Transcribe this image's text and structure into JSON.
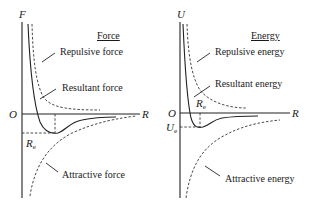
{
  "force_panel": {
    "title": "Force",
    "y_axis": "F",
    "x_axis": "R",
    "origin": "O",
    "re_label": "R",
    "re_sub": "e",
    "labels": {
      "repulsive": "Repulsive force",
      "resultant": "Resultant force",
      "attractive": "Attractive force"
    }
  },
  "energy_panel": {
    "title": "Energy",
    "y_axis": "U",
    "x_axis": "R",
    "origin": "O",
    "re_label": "R",
    "re_sub": "e",
    "ue_label": "U",
    "ue_sub": "e",
    "labels": {
      "repulsive": "Repulsive energy",
      "resultant": "Resultant energy",
      "attractive": "Attractive energy"
    }
  },
  "colors": {
    "line": "#222222",
    "background": "#ffffff"
  }
}
